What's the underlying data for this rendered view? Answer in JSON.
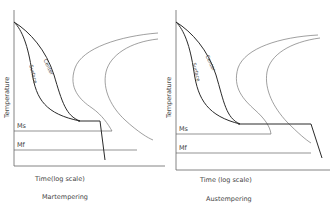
{
  "panels": [
    {
      "caption": "Martempering",
      "xlabel": "Time(log scale)",
      "ylabel": "Temperature",
      "ms_label": "Ms",
      "mf_label": "Mf",
      "curve_labels": {
        "center": "Center",
        "surface": "Surface"
      }
    },
    {
      "caption": "Austempering",
      "xlabel": "Time (log scale)",
      "ylabel": "Temperature",
      "ms_label": "Ms",
      "mf_label": "Mf",
      "curve_labels": {
        "center": "Center",
        "surface": "Surface"
      }
    }
  ],
  "colors": {
    "line": "#2a2a2a",
    "ttt_curve": "#777777",
    "text": "#444444"
  }
}
